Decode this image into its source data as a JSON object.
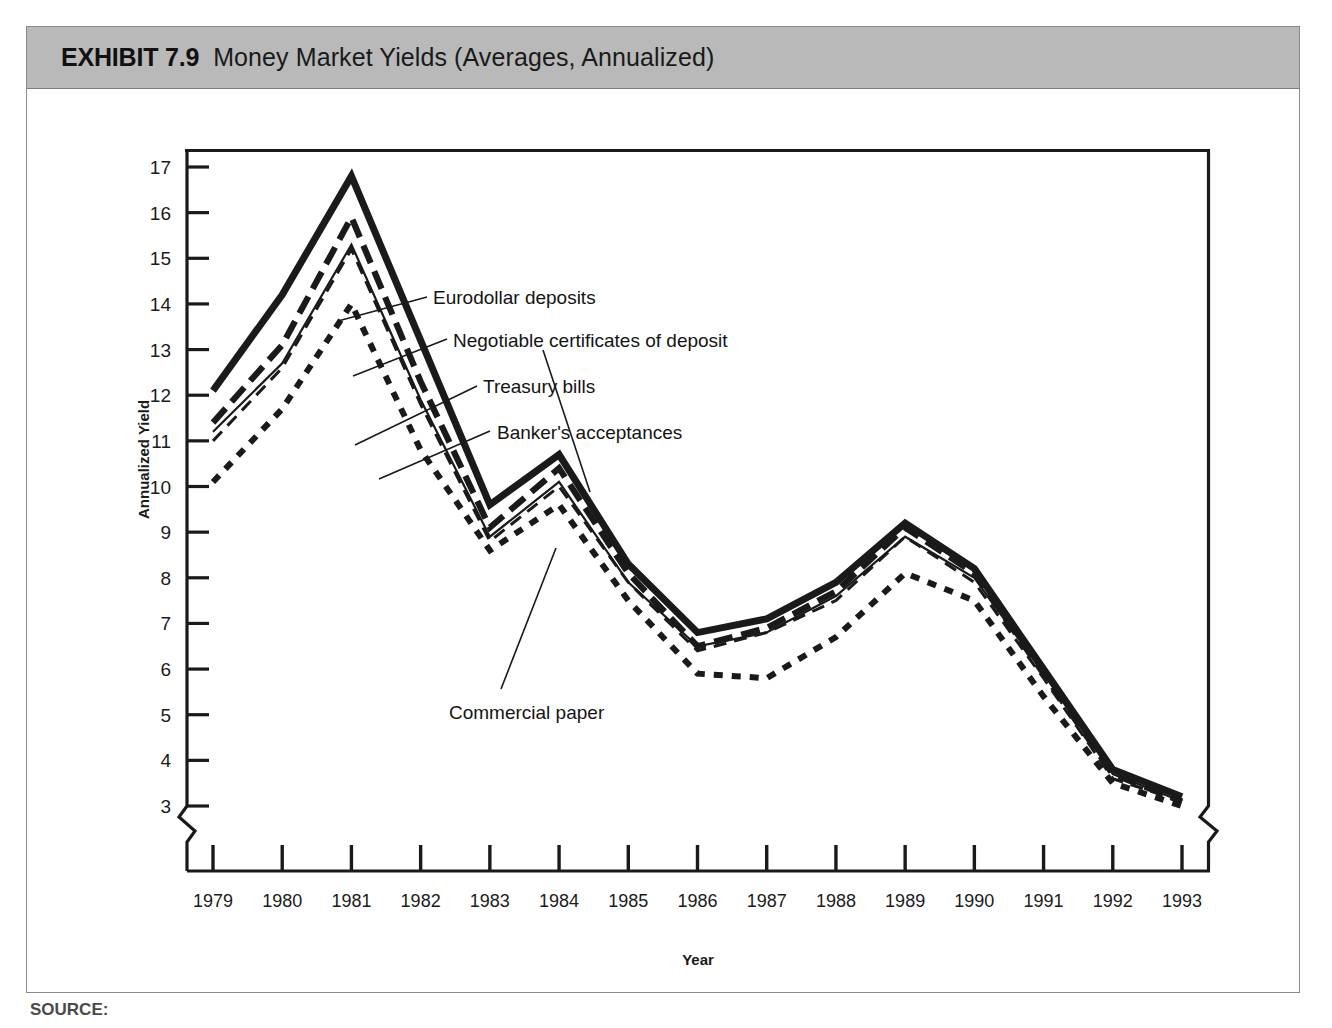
{
  "figure": {
    "exhibit_number": "EXHIBIT 7.9",
    "exhibit_title": "Money Market Yields (Averages, Annualized)",
    "source_prefix": "SOURCE:",
    "band_color": "#b9b9b9"
  },
  "chart_data": {
    "type": "line",
    "title": "Money Market Yields (Averages, Annualized)",
    "xlabel": "Year",
    "ylabel": "Annualized Yield",
    "x": [
      1979,
      1980,
      1981,
      1982,
      1983,
      1984,
      1985,
      1986,
      1987,
      1988,
      1989,
      1990,
      1991,
      1992,
      1993
    ],
    "xtick_labels": [
      "1979",
      "1980",
      "1981",
      "1982",
      "1983",
      "1984",
      "1985",
      "1986",
      "1987",
      "1988",
      "1989",
      "1990",
      "1991",
      "1992",
      "1993"
    ],
    "ytick_labels": [
      "3",
      "4",
      "5",
      "6",
      "7",
      "8",
      "9",
      "10",
      "11",
      "12",
      "13",
      "14",
      "15",
      "16",
      "17"
    ],
    "ylim": [
      3,
      17
    ],
    "xlim": [
      1979,
      1993
    ],
    "y_axis_break": true,
    "x_axis_break": true,
    "grid": false,
    "legend": "annotations",
    "series": [
      {
        "name": "Eurodollar deposits",
        "style": "thick-solid",
        "color": "#1a1a1a",
        "values": [
          12.1,
          14.2,
          16.8,
          13.2,
          9.6,
          10.7,
          8.3,
          6.8,
          7.1,
          7.9,
          9.2,
          8.2,
          6.0,
          3.8,
          3.2
        ]
      },
      {
        "name": "Negotiable certificates of deposit",
        "style": "long-dash",
        "color": "#1a1a1a",
        "values": [
          11.4,
          13.1,
          15.9,
          12.3,
          9.1,
          10.4,
          8.1,
          6.5,
          6.9,
          7.7,
          9.1,
          8.1,
          5.9,
          3.7,
          3.1
        ]
      },
      {
        "name": "Commercial paper",
        "style": "thin-solid",
        "color": "#1a1a1a",
        "values": [
          11.2,
          12.7,
          15.3,
          11.9,
          8.9,
          10.1,
          7.9,
          6.5,
          6.8,
          7.6,
          8.9,
          8.0,
          5.9,
          3.7,
          3.1
        ]
      },
      {
        "name": "Banker's acceptances",
        "style": "medium-dash",
        "color": "#1a1a1a",
        "values": [
          11.0,
          12.6,
          15.2,
          11.8,
          8.8,
          10.0,
          7.9,
          6.4,
          6.8,
          7.5,
          8.9,
          7.9,
          5.8,
          3.6,
          3.1
        ]
      },
      {
        "name": "Treasury bills",
        "style": "fine-dot",
        "color": "#1a1a1a",
        "values": [
          10.1,
          11.7,
          14.0,
          10.8,
          8.6,
          9.6,
          7.5,
          5.9,
          5.8,
          6.7,
          8.1,
          7.5,
          5.4,
          3.5,
          3.0
        ]
      }
    ],
    "annotations": [
      {
        "text": "Eurodollar deposits",
        "series": "Eurodollar deposits"
      },
      {
        "text": "Negotiable certificates of deposit",
        "series": "Negotiable certificates of deposit"
      },
      {
        "text": "Treasury bills",
        "series": "Treasury bills"
      },
      {
        "text": "Banker's acceptances",
        "series": "Banker's acceptances"
      },
      {
        "text": "Commercial paper",
        "series": "Commercial paper"
      }
    ]
  }
}
